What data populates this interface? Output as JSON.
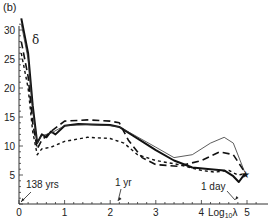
{
  "panel_label": "(b)",
  "series_label": "δ",
  "chart_data": {
    "type": "line",
    "title": "(b)",
    "xlabel": "Log10λ",
    "ylabel": "δ",
    "xlim": [
      0,
      5.3
    ],
    "ylim": [
      0,
      32
    ],
    "xticks": [
      0,
      1,
      2,
      3,
      4,
      5
    ],
    "yticks": [
      5,
      10,
      15,
      20,
      25,
      30
    ],
    "grid": false,
    "legend": null,
    "annotations": [
      {
        "text": "138 yrs",
        "x": 0.05,
        "y": 0
      },
      {
        "text": "1 yr",
        "x": 2.17,
        "y": 0
      },
      {
        "text": "1 day",
        "x": 4.75,
        "y": 0
      }
    ],
    "series": [
      {
        "name": "thick solid",
        "style": "solid-thick",
        "x": [
          0.05,
          0.2,
          0.3,
          0.4,
          0.5,
          0.6,
          0.7,
          0.8,
          1.0,
          1.3,
          1.6,
          2.0,
          2.2,
          2.5,
          3.0,
          3.4,
          3.8,
          4.2,
          4.5,
          4.7,
          4.82,
          4.95
        ],
        "y": [
          32,
          26,
          17,
          10.5,
          12,
          11.5,
          12.5,
          12,
          13.5,
          13.8,
          13.7,
          13.6,
          13.3,
          11.8,
          9.3,
          7.5,
          6.3,
          6.0,
          5.8,
          4.8,
          3.8,
          5.2
        ]
      },
      {
        "name": "thin solid",
        "style": "solid-thin",
        "x": [
          0.05,
          0.2,
          0.3,
          0.4,
          0.5,
          0.7,
          1.0,
          1.5,
          2.0,
          2.2,
          2.5,
          3.0,
          3.4,
          3.8,
          4.2,
          4.5,
          4.7,
          4.95
        ],
        "y": [
          31,
          25,
          16,
          10.5,
          11.8,
          12.2,
          13.5,
          13.7,
          13.5,
          13.3,
          12.0,
          9.8,
          8.0,
          8.5,
          10.5,
          11.5,
          10.5,
          5.5
        ]
      },
      {
        "name": "long dash",
        "style": "dashed",
        "x": [
          0.05,
          0.2,
          0.3,
          0.4,
          0.5,
          0.7,
          1.0,
          1.5,
          2.0,
          2.2,
          2.4,
          2.7,
          3.0,
          3.5,
          4.0,
          4.4,
          4.7,
          4.95
        ],
        "y": [
          28,
          22,
          14,
          9.5,
          11,
          12.5,
          14.3,
          14.5,
          14.3,
          14.0,
          11.0,
          8.0,
          6.8,
          6.5,
          7.5,
          9.0,
          8.5,
          5.5
        ]
      },
      {
        "name": "short dash",
        "style": "dotted",
        "x": [
          0.05,
          0.2,
          0.3,
          0.4,
          0.5,
          0.7,
          1.0,
          1.5,
          2.0,
          2.3,
          2.6,
          3.0,
          3.5,
          4.0,
          4.3,
          4.6,
          4.8,
          4.95
        ],
        "y": [
          26,
          20,
          12.5,
          8.5,
          9.5,
          9.8,
          10.8,
          11.5,
          11.3,
          10.5,
          8.5,
          7.5,
          6.8,
          5.8,
          5.5,
          5.8,
          5.0,
          5.2
        ]
      }
    ]
  }
}
